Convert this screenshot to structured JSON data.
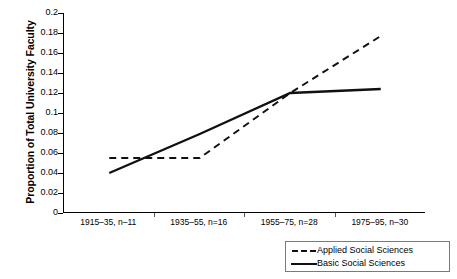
{
  "chart_data": {
    "type": "line",
    "title": "",
    "xlabel": "",
    "ylabel": "Proportion of Total University Faculty",
    "categories": [
      "1915–35, n–11",
      "1935–55, n=16",
      "1955–75, n=28",
      "1975–95, n–30"
    ],
    "ylim": [
      0,
      0.2
    ],
    "ytick_labels": [
      "0.2",
      "0.18",
      "0.16",
      "0.14",
      "0.12",
      "0.1",
      "0.08",
      "0.06",
      "0.04",
      "0.02",
      "0"
    ],
    "ytick_values": [
      0.2,
      0.18,
      0.16,
      0.14,
      0.12,
      0.1,
      0.08,
      0.06,
      0.04,
      0.02,
      0
    ],
    "grid": false,
    "legend_position": "bottom-right",
    "series": [
      {
        "name": "Applied Social Sciences",
        "style": "dashed",
        "color": "#111111",
        "values": [
          0.055,
          0.055,
          0.12,
          0.177
        ]
      },
      {
        "name": "Basic Social Sciences",
        "style": "solid",
        "color": "#111111",
        "values": [
          0.04,
          0.079,
          0.12,
          0.124
        ]
      }
    ]
  },
  "legend": {
    "entries": [
      {
        "label": "Applied Social Sciences"
      },
      {
        "label": "Basic Social Sciences"
      }
    ]
  }
}
